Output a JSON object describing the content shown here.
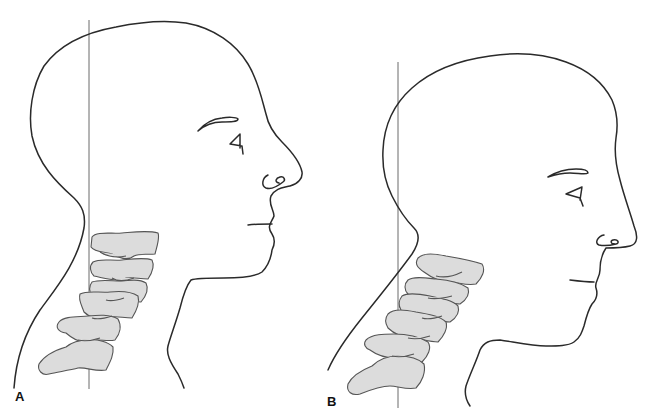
{
  "figure": {
    "type": "medical-illustration",
    "colors": {
      "outline": "#2a2a2a",
      "plumb_line": "#6a6a6a",
      "vertebra_fill": "#dcdcdc",
      "vertebra_stroke": "#555555",
      "background": "#ffffff"
    },
    "panels": [
      {
        "label": "A",
        "description": "Forward head posture; face and cervical spine anterior to the plumb line"
      },
      {
        "label": "B",
        "description": "Corrected posture; cervical spine aligned with the plumb line"
      }
    ]
  }
}
